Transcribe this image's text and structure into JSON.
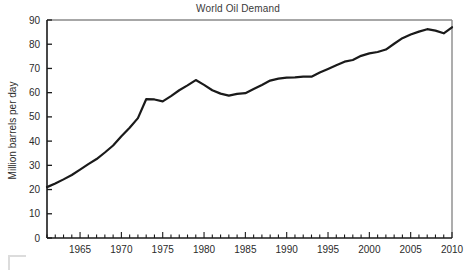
{
  "chart_data": {
    "type": "line",
    "title": "World Oil Demand",
    "xlabel": "",
    "ylabel": "Million barrels per day",
    "xlim": [
      1961,
      2010
    ],
    "ylim": [
      0,
      90
    ],
    "ytick_step": 10,
    "yticks": [
      0,
      10,
      20,
      30,
      40,
      50,
      60,
      70,
      80,
      90
    ],
    "ytick_labels": [
      "0",
      "10",
      "20",
      "30",
      "40",
      "50",
      "60",
      "70",
      "80",
      "90"
    ],
    "xticks_minor_step": 1,
    "xtick_labels": [
      "1965",
      "1970",
      "1975",
      "1980",
      "1985",
      "1990",
      "1995",
      "2000",
      "2005",
      "2010"
    ],
    "xticks_labeled": [
      1965,
      1970,
      1975,
      1980,
      1985,
      1990,
      1995,
      2000,
      2005,
      2010
    ],
    "grid": false,
    "legend": false,
    "legend_position": "none",
    "line_color": "#1a1a1a",
    "line_width": 2.2,
    "frame_color": "#8a8a8a",
    "axis_color": "#1a1a1a",
    "series": [
      {
        "name": "World Oil Demand",
        "x": [
          1961,
          1962,
          1963,
          1964,
          1965,
          1966,
          1967,
          1968,
          1969,
          1970,
          1971,
          1972,
          1973,
          1974,
          1975,
          1976,
          1977,
          1978,
          1979,
          1980,
          1981,
          1982,
          1983,
          1984,
          1985,
          1986,
          1987,
          1988,
          1989,
          1990,
          1991,
          1992,
          1993,
          1994,
          1995,
          1996,
          1997,
          1998,
          1999,
          2000,
          2001,
          2002,
          2003,
          2004,
          2005,
          2006,
          2007,
          2008,
          2009,
          2010
        ],
        "values": [
          21.0,
          22.5,
          24.2,
          26.0,
          28.2,
          30.5,
          32.6,
          35.3,
          38.2,
          42.0,
          45.5,
          49.5,
          57.3,
          57.2,
          56.4,
          58.6,
          61.0,
          63.0,
          65.2,
          63.2,
          61.0,
          59.6,
          58.8,
          59.5,
          59.8,
          61.5,
          63.2,
          65.0,
          65.8,
          66.2,
          66.3,
          66.6,
          66.6,
          68.3,
          69.8,
          71.3,
          72.8,
          73.5,
          75.2,
          76.2,
          76.8,
          77.8,
          80.2,
          82.5,
          84.0,
          85.2,
          86.2,
          85.6,
          84.5,
          87.0
        ]
      }
    ]
  }
}
